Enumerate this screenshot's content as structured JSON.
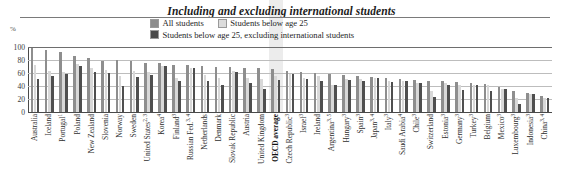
{
  "header": {
    "title": "Including and excluding international students",
    "unit_label": "%"
  },
  "legend": {
    "items": [
      {
        "label": "All students",
        "swatch": "all-students-swatch",
        "color": "#8e8e8e"
      },
      {
        "label": "Students below age 25",
        "swatch": "students-below-25-swatch",
        "color": "#d8d8d8"
      },
      {
        "label": "Students below age 25, excluding international students",
        "swatch": "students-below-25-excl-intl-swatch",
        "color": "#4f4f4f"
      }
    ]
  },
  "chart_data": {
    "type": "bar",
    "title": "Including and excluding international students",
    "xlabel": "",
    "ylabel": "%",
    "ylim": [
      0,
      100
    ],
    "yticks": [
      0,
      20,
      40,
      60,
      80,
      100
    ],
    "grid": true,
    "legend_position": "top-center",
    "highlight_category": "OECD average",
    "categories": [
      "Australia",
      "Iceland",
      "Portugal¹",
      "Poland",
      "New Zealand",
      "Slovenia",
      "Norway",
      "Sweden",
      "United States²‚³",
      "Korea⁴",
      "Finland³",
      "Russian Fed.³‚⁴",
      "Netherlands",
      "Denmark",
      "Slovak Republic",
      "Austria",
      "United Kingdom",
      "OECD average",
      "Czech Republic³",
      "Israel³",
      "Ireland",
      "Argentina³‚⁵",
      "Hungary³",
      "Spain³",
      "Japan³‚⁴",
      "Italy³",
      "Saudi Arabia⁴",
      "Chile³",
      "Switzerland",
      "Estonia³",
      "Germany³",
      "Turkey³",
      "Belgium",
      "Mexico³",
      "Luxembourg³",
      "Indonesia³",
      "China³‚⁴"
    ],
    "categories_plain": [
      "Australia",
      "Iceland",
      "Portugal",
      "Poland",
      "New Zealand",
      "Slovenia",
      "Norway",
      "Sweden",
      "United States",
      "Korea",
      "Finland",
      "Russian Fed.",
      "Netherlands",
      "Denmark",
      "Slovak Republic",
      "Austria",
      "United Kingdom",
      "OECD average",
      "Czech Republic",
      "Israel",
      "Ireland",
      "Argentina",
      "Hungary",
      "Spain",
      "Japan",
      "Italy",
      "Saudi Arabia",
      "Chile",
      "Switzerland",
      "Estonia",
      "Germany",
      "Turkey",
      "Belgium",
      "Mexico",
      "Luxembourg",
      "Indonesia",
      "China"
    ],
    "category_superscripts": [
      "",
      "",
      "1",
      "",
      "",
      "",
      "",
      "",
      "2, 3",
      "4",
      "3",
      "3, 4",
      "",
      "",
      "",
      "",
      "",
      "",
      "3",
      "3",
      "",
      "3, 5",
      "3",
      "3",
      "3, 4",
      "3",
      "4",
      "3",
      "",
      "3",
      "3",
      "3",
      "",
      "3",
      "3",
      "3",
      "3, 4"
    ],
    "series": [
      {
        "name": "All students",
        "color": "#8e8e8e",
        "values": [
          98,
          95,
          93,
          86,
          83,
          79,
          80,
          78,
          76,
          75,
          73,
          73,
          71,
          70,
          69,
          68,
          67,
          66,
          63,
          61,
          60,
          58,
          57,
          55,
          54,
          52,
          51,
          49,
          48,
          47,
          46,
          44,
          43,
          38,
          33,
          29,
          24
        ]
      },
      {
        "name": "Students below age 25",
        "color": "#d8d8d8",
        "values": [
          72,
          63,
          61,
          74,
          68,
          64,
          55,
          63,
          61,
          71,
          53,
          67,
          57,
          52,
          63,
          53,
          51,
          55,
          59,
          52,
          55,
          41,
          51,
          51,
          52,
          47,
          48,
          45,
          32,
          44,
          41,
          42,
          41,
          36,
          22,
          27,
          21
        ]
      },
      {
        "name": "Students below age 25, excluding international students",
        "color": "#4f4f4f",
        "values": [
          51,
          55,
          59,
          71,
          62,
          60,
          40,
          54,
          57,
          71,
          48,
          67,
          48,
          42,
          62,
          44,
          36,
          50,
          58,
          51,
          47,
          41,
          50,
          48,
          52,
          46,
          48,
          45,
          23,
          41,
          34,
          42,
          32,
          36,
          12,
          27,
          21
        ]
      }
    ]
  }
}
